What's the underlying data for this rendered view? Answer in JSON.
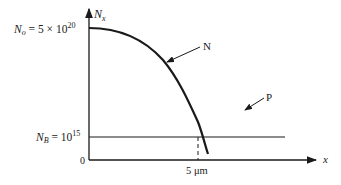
{
  "diagram": {
    "y_axis_label": "N",
    "y_axis_label_sub": "x",
    "x_axis_label": "x",
    "origin_label": "0",
    "n0_label": {
      "symbol": "N",
      "sub": "o",
      "eq": " = 5 × 10",
      "exp": "20"
    },
    "nb_label": {
      "symbol": "N",
      "sub": "B",
      "eq": " = 10",
      "exp": "15"
    },
    "curve_label": "N",
    "line_label": "P",
    "junction_label": "5 μm",
    "colors": {
      "ink": "#1a1a1a",
      "background": "#ffffff"
    }
  }
}
